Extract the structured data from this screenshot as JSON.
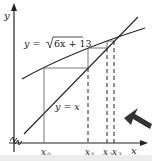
{
  "diagram": {
    "curve_label": "y = √6x + 13",
    "curve_label_prefix": "y = ",
    "curve_label_radicand": "6x + 13",
    "line_label": "y = x",
    "axis_x_label": "x",
    "axis_y_label": "y",
    "x_ticks": [
      {
        "label": "x",
        "sub": "0"
      },
      {
        "label": "x",
        "sub": "1"
      },
      {
        "label": "x",
        "sub": "2"
      },
      {
        "label": "x",
        "sub": "3"
      }
    ],
    "colors": {
      "ink": "#222222",
      "grid_lines": "#555555",
      "background": "#ffffff",
      "bottom_bar": "#ececec",
      "pointer": "#333333"
    }
  }
}
